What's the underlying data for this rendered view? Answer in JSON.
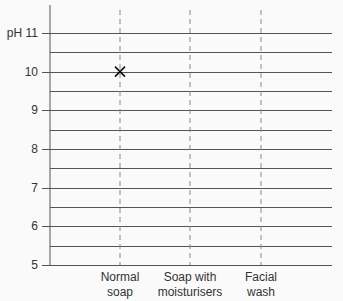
{
  "chart_data": {
    "type": "scatter",
    "title": "",
    "xlabel": "",
    "ylabel": "pH",
    "categories": [
      "Normal soap",
      "Soap with moisturisers",
      "Facial wash"
    ],
    "category_labels": [
      [
        "Normal",
        "soap"
      ],
      [
        "Soap with",
        "moisturisers"
      ],
      [
        "Facial",
        "wash"
      ]
    ],
    "y_ticks": [
      5,
      6,
      7,
      8,
      9,
      10,
      11
    ],
    "y_tick_labels": [
      "5",
      "6",
      "7",
      "8",
      "9",
      "10",
      "pH 11"
    ],
    "ylim": [
      5,
      11.5
    ],
    "minor_grid_step": 0.5,
    "grid": true,
    "points": [
      {
        "category": "Normal soap",
        "y": 10,
        "marker": "x"
      }
    ],
    "series": [
      {
        "name": "pH",
        "values": [
          10,
          null,
          null
        ]
      }
    ]
  },
  "colors": {
    "grid": "#555555",
    "dashed": "#888888",
    "marker": "#111111",
    "background": "#fafafa"
  }
}
